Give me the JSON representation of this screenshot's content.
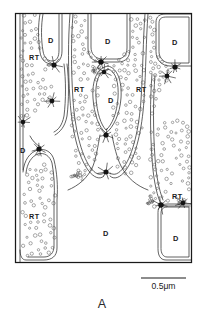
{
  "figure": {
    "panel_letter": "A",
    "frame": {
      "x": 15,
      "y": 13,
      "width": 177,
      "height": 250
    },
    "colors": {
      "background": "#ffffff",
      "frame_stroke": "#1a1a1a",
      "membrane_stroke": "#2e2e2e",
      "vesicle_stroke": "#555555",
      "junction_fill": "#141414",
      "label_color": "#1a1a1a"
    }
  },
  "scale_bar": {
    "label": "0.5μm",
    "x1": 141,
    "x2": 186,
    "y": 278
  },
  "labels": [
    {
      "text": "D",
      "x": 48,
      "y": 43,
      "kind": "dense"
    },
    {
      "text": "RT",
      "x": 29,
      "y": 60,
      "kind": "vesicular"
    },
    {
      "text": "D",
      "x": 105,
      "y": 44,
      "kind": "dense"
    },
    {
      "text": "D",
      "x": 172,
      "y": 45,
      "kind": "dense"
    },
    {
      "text": "RT",
      "x": 74,
      "y": 92,
      "kind": "vesicular"
    },
    {
      "text": "D",
      "x": 108,
      "y": 103,
      "kind": "dense"
    },
    {
      "text": "RT",
      "x": 136,
      "y": 92,
      "kind": "vesicular"
    },
    {
      "text": "D",
      "x": 20,
      "y": 153,
      "kind": "dense"
    },
    {
      "text": "RT",
      "x": 29,
      "y": 219,
      "kind": "vesicular"
    },
    {
      "text": "RT",
      "x": 172,
      "y": 199,
      "kind": "vesicular"
    },
    {
      "text": "D",
      "x": 103,
      "y": 236,
      "kind": "dense"
    },
    {
      "text": "D",
      "x": 173,
      "y": 241,
      "kind": "dense"
    }
  ],
  "membranes": [
    {
      "name": "left-d-cell-upper",
      "d": "M 40 14 C 38 24 38 40 40 52 C 41 60 46 64 52 64 C 58 64 62 59 62 51 L 62 14"
    },
    {
      "name": "left-d-cell-upper-inner",
      "d": "M 43 14 C 41 25 41 40 43 51 C 44 58 48 61 52 61 C 57 61 59 57 59 50 L 59 14"
    },
    {
      "name": "left-rt-left-border",
      "d": "M 20 14 L 20 263"
    },
    {
      "name": "left-rt-inner-border",
      "d": "M 23 14 L 23 170"
    },
    {
      "name": "mid-left-septum-upper",
      "d": "M 64 64 C 66 80 66 100 64 116 C 62 126 58 130 54 132"
    },
    {
      "name": "mid-left-septum-upper-b",
      "d": "M 67 64 C 69 80 69 100 67 116 C 65 127 60 132 55 135"
    },
    {
      "name": "left-lower-rt-outline",
      "d": "M 23 172 C 24 160 30 152 38 150 C 45 148 52 152 54 160 C 57 172 58 186 57 200 L 57 248 C 57 256 52 260 44 260 L 26 260 C 22 260 20 256 20 250"
    },
    {
      "name": "left-lower-rt-inner",
      "d": "M 26 173 C 27 163 32 156 38 154 C 44 152 50 156 52 163 C 54 174 55 187 54 200 L 54 246 C 54 253 50 257 44 257 L 28 257"
    },
    {
      "name": "left-d-strip-lower",
      "d": "M 30 136 C 32 140 36 145 41 147"
    },
    {
      "name": "center-d-cell-top",
      "d": "M 88 14 L 88 48 C 88 56 92 61 100 62 L 118 62 C 126 62 130 57 130 49 L 130 14"
    },
    {
      "name": "center-d-cell-top-inner",
      "d": "M 91 14 L 91 47 C 91 54 95 58 101 59 L 117 59 C 123 59 127 55 127 48 L 127 14"
    },
    {
      "name": "center-oval-d",
      "d": "M 108 66 C 96 68 92 82 93 98 C 94 114 99 128 106 133 C 113 128 120 114 121 98 C 122 82 118 68 108 66 Z"
    },
    {
      "name": "center-oval-d-inner",
      "d": "M 108 69 C 98 71 95 83 96 98 C 97 113 101 125 106 130 C 112 125 117 113 118 98 C 119 83 116 71 108 69 Z"
    },
    {
      "name": "center-stalk-left",
      "d": "M 100 135 C 98 146 96 158 93 166 C 88 178 78 186 68 190"
    },
    {
      "name": "center-stalk-right",
      "d": "M 112 135 C 114 146 117 158 121 166 C 127 178 137 186 148 190"
    },
    {
      "name": "center-lobe-left-outer",
      "d": "M 70 14 C 68 40 68 70 70 100 C 72 130 78 156 88 170 C 94 178 100 180 104 176"
    },
    {
      "name": "center-lobe-left-inner",
      "d": "M 73 14 C 71 40 71 70 73 100 C 75 129 81 154 90 167 C 95 174 100 176 104 173"
    },
    {
      "name": "center-lobe-right-outer",
      "d": "M 148 14 C 146 40 146 70 144 100 C 142 130 136 156 126 170 C 120 178 114 180 110 176"
    },
    {
      "name": "center-lobe-right-inner",
      "d": "M 145 14 C 143 40 143 70 141 100 C 139 129 133 154 124 167 C 119 174 114 176 110 173"
    },
    {
      "name": "right-d-cell-top",
      "d": "M 156 22 C 156 16 160 14 166 14 L 192 14 L 192 66 L 170 66 C 162 66 156 60 156 52 Z"
    },
    {
      "name": "right-d-cell-top-inner",
      "d": "M 159 23 C 159 18 162 17 167 17 L 189 17 L 189 63 L 170 63 C 164 63 159 58 159 52 Z"
    },
    {
      "name": "right-rt-column-outer",
      "d": "M 152 74 C 150 100 150 130 152 158 C 153 176 156 192 160 202"
    },
    {
      "name": "right-rt-column-inner",
      "d": "M 155 75 C 153 100 153 130 155 158 C 156 175 159 190 163 200"
    },
    {
      "name": "right-d-cell-bottom",
      "d": "M 158 212 C 158 206 162 204 168 204 L 192 204 L 192 260 L 166 260 C 160 260 158 255 158 249 Z"
    },
    {
      "name": "right-d-cell-bottom-inner",
      "d": "M 161 213 C 161 208 164 207 169 207 L 189 207 L 189 257 L 167 257 C 163 257 161 253 161 249 Z"
    },
    {
      "name": "right-junction-bridge",
      "d": "M 160 206 L 190 206"
    },
    {
      "name": "right-edge",
      "d": "M 192 14 L 192 263"
    }
  ],
  "junctions": [
    {
      "name": "junction-left-upper",
      "x": 54,
      "y": 65,
      "r": 2.6
    },
    {
      "name": "junction-left-mid",
      "x": 52,
      "y": 101,
      "r": 2.4
    },
    {
      "name": "junction-left-lowmid",
      "x": 23,
      "y": 122,
      "r": 2.3
    },
    {
      "name": "junction-left-lower",
      "x": 39,
      "y": 149,
      "r": 2.6
    },
    {
      "name": "junction-center-upper",
      "x": 101,
      "y": 62,
      "r": 2.7
    },
    {
      "name": "junction-center-upper2",
      "x": 104,
      "y": 72,
      "r": 2.3
    },
    {
      "name": "junction-center-mid",
      "x": 106,
      "y": 135,
      "r": 2.6
    },
    {
      "name": "junction-center-lower",
      "x": 106,
      "y": 172,
      "r": 2.5
    },
    {
      "name": "junction-right-upper",
      "x": 175,
      "y": 67,
      "r": 2.6
    },
    {
      "name": "junction-right-upper2",
      "x": 167,
      "y": 76,
      "r": 2.4
    },
    {
      "name": "junction-right-lower",
      "x": 161,
      "y": 205,
      "r": 2.7
    },
    {
      "name": "junction-right-lower2",
      "x": 183,
      "y": 203,
      "r": 2.3
    }
  ]
}
